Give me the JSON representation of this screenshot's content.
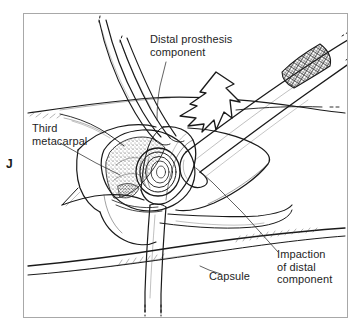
{
  "figure": {
    "panel_letter": "J",
    "kind": "surgical-line-illustration",
    "background_color": "#ffffff",
    "ink_color": "#1a1a1a",
    "frame_color": "#a8a8a8",
    "text_color": "#1e1e1e"
  },
  "labels": {
    "distal_prosthesis": "Distal prosthesis\ncomponent",
    "third_metacarpal": "Third\nmetacarpal",
    "capsule": "Capsule",
    "impaction": "Impaction\nof distal\ncomponent"
  },
  "annotations": {
    "impaction_arrow": "large-hollow-arrow-pointing-down-left",
    "instrument": "impactor-with-crosshatched-grip",
    "retractors": "two-curved-retractor-blades-upper-left-and-one-lower-blade"
  }
}
